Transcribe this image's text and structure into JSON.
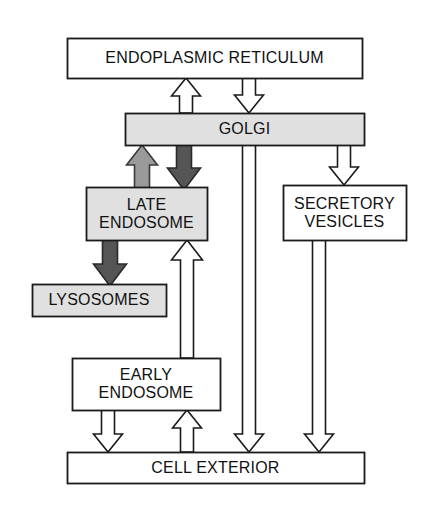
{
  "diagram": {
    "type": "flow-diagram",
    "background_color": "#ffffff",
    "stroke_color": "#1a1a1a",
    "nodes": [
      {
        "id": "endoplasmic-reticulum",
        "label": "ENDOPLASMIC RETICULUM",
        "x": 67,
        "y": 38,
        "w": 295,
        "h": 40,
        "fill": "#ffffff",
        "font_size": 16
      },
      {
        "id": "golgi",
        "label": "GOLGI",
        "x": 125,
        "y": 113,
        "w": 239,
        "h": 32,
        "fill": "#e0e0e0",
        "font_size": 16
      },
      {
        "id": "late-endosome",
        "label": "LATE\nENDOSOME",
        "x": 86,
        "y": 187,
        "w": 121,
        "h": 53,
        "fill": "#e0e0e0",
        "font_size": 16
      },
      {
        "id": "secretory-vesicles",
        "label": "SECRETORY\nVESICLES",
        "x": 283,
        "y": 185,
        "w": 123,
        "h": 55,
        "fill": "#ffffff",
        "font_size": 16
      },
      {
        "id": "lysosomes",
        "label": "LYSOSOMES",
        "x": 32,
        "y": 284,
        "w": 134,
        "h": 32,
        "fill": "#e0e0e0",
        "font_size": 16
      },
      {
        "id": "early-endosome",
        "label": "EARLY\nENDOSOME",
        "x": 72,
        "y": 358,
        "w": 148,
        "h": 52,
        "fill": "#ffffff",
        "font_size": 16
      },
      {
        "id": "cell-exterior",
        "label": "CELL EXTERIOR",
        "x": 67,
        "y": 452,
        "w": 297,
        "h": 31,
        "fill": "#ffffff",
        "font_size": 16
      }
    ],
    "arrows": [
      {
        "id": "golgi-to-er",
        "from": "golgi",
        "to": "endoplasmic-reticulum",
        "direction": "up",
        "fill": "#ffffff",
        "outline": "#1a1a1a",
        "cx": 186,
        "shaft_w": 13,
        "head_w": 29,
        "y_tail": 113,
        "y_tip": 78,
        "head_len": 18
      },
      {
        "id": "er-to-golgi",
        "from": "endoplasmic-reticulum",
        "to": "golgi",
        "direction": "down",
        "fill": "#ffffff",
        "outline": "#1a1a1a",
        "cx": 249,
        "shaft_w": 13,
        "head_w": 29,
        "y_tail": 78,
        "y_tip": 113,
        "head_len": 18
      },
      {
        "id": "late-endosome-to-golgi",
        "from": "late-endosome",
        "to": "golgi",
        "direction": "up",
        "fill": "#9a9a9a",
        "outline": "#3a3a3a",
        "cx": 142,
        "shaft_w": 15,
        "head_w": 31,
        "y_tail": 190,
        "y_tip": 145,
        "head_len": 20
      },
      {
        "id": "golgi-to-late-endosome",
        "from": "golgi",
        "to": "late-endosome",
        "direction": "down",
        "fill": "#555555",
        "outline": "#2a2a2a",
        "cx": 184,
        "shaft_w": 15,
        "head_w": 33,
        "y_tail": 145,
        "y_tip": 190,
        "head_len": 22
      },
      {
        "id": "golgi-to-secretory-vesicles",
        "from": "golgi",
        "to": "secretory-vesicles",
        "direction": "down",
        "fill": "#ffffff",
        "outline": "#1a1a1a",
        "cx": 344,
        "shaft_w": 13,
        "head_w": 29,
        "y_tail": 145,
        "y_tip": 185,
        "head_len": 18
      },
      {
        "id": "late-endosome-to-lysosomes",
        "from": "late-endosome",
        "to": "lysosomes",
        "direction": "down",
        "fill": "#555555",
        "outline": "#2a2a2a",
        "cx": 110,
        "shaft_w": 15,
        "head_w": 33,
        "y_tail": 240,
        "y_tip": 286,
        "head_len": 22
      },
      {
        "id": "early-endosome-to-late-endosome",
        "from": "early-endosome",
        "to": "late-endosome",
        "direction": "up",
        "fill": "#ffffff",
        "outline": "#1a1a1a",
        "cx": 187,
        "shaft_w": 13,
        "head_w": 31,
        "y_tail": 358,
        "y_tip": 240,
        "head_len": 20
      },
      {
        "id": "early-endosome-to-cell-exterior",
        "from": "early-endosome",
        "to": "cell-exterior",
        "direction": "down",
        "fill": "#ffffff",
        "outline": "#1a1a1a",
        "cx": 108,
        "shaft_w": 13,
        "head_w": 29,
        "y_tail": 410,
        "y_tip": 452,
        "head_len": 18
      },
      {
        "id": "cell-exterior-to-early-endosome",
        "from": "cell-exterior",
        "to": "early-endosome",
        "direction": "up",
        "fill": "#ffffff",
        "outline": "#1a1a1a",
        "cx": 187,
        "shaft_w": 13,
        "head_w": 29,
        "y_tail": 452,
        "y_tip": 410,
        "head_len": 18
      },
      {
        "id": "golgi-to-cell-exterior",
        "from": "golgi",
        "to": "cell-exterior",
        "direction": "down",
        "fill": "#ffffff",
        "outline": "#1a1a1a",
        "cx": 249,
        "shaft_w": 13,
        "head_w": 29,
        "y_tail": 145,
        "y_tip": 452,
        "head_len": 18
      },
      {
        "id": "secretory-vesicles-to-cell-exterior",
        "from": "secretory-vesicles",
        "to": "cell-exterior",
        "direction": "down",
        "fill": "#ffffff",
        "outline": "#1a1a1a",
        "cx": 319,
        "shaft_w": 13,
        "head_w": 29,
        "y_tail": 240,
        "y_tip": 452,
        "head_len": 18
      }
    ]
  }
}
